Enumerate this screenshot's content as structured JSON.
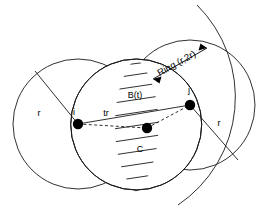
{
  "diagram": {
    "nodes": [
      {
        "id": "i",
        "label": "i",
        "x": 78,
        "y": 124
      },
      {
        "id": "k",
        "label": "",
        "x": 147,
        "y": 128
      },
      {
        "id": "j",
        "label": "j",
        "x": 190,
        "y": 105
      }
    ],
    "labels": {
      "node_i": "i",
      "node_j": "j",
      "radius_left": "r",
      "radius_right": "r",
      "distance_tr": "tr",
      "region_b": "B(t)",
      "region_c": "C",
      "ring": "Ring (r,2r)"
    },
    "circles": [
      {
        "name": "circle-i-r",
        "center": "i",
        "radius": 65,
        "label": "r"
      },
      {
        "name": "circle-j-r",
        "center": "j",
        "radius": 65,
        "label": "r"
      },
      {
        "name": "arc-i-2r",
        "center": "i",
        "radius": 130,
        "label": "2r"
      }
    ],
    "colors": {
      "stroke": "#1a1a1a",
      "node": "#000000",
      "background": "#ffffff"
    }
  }
}
